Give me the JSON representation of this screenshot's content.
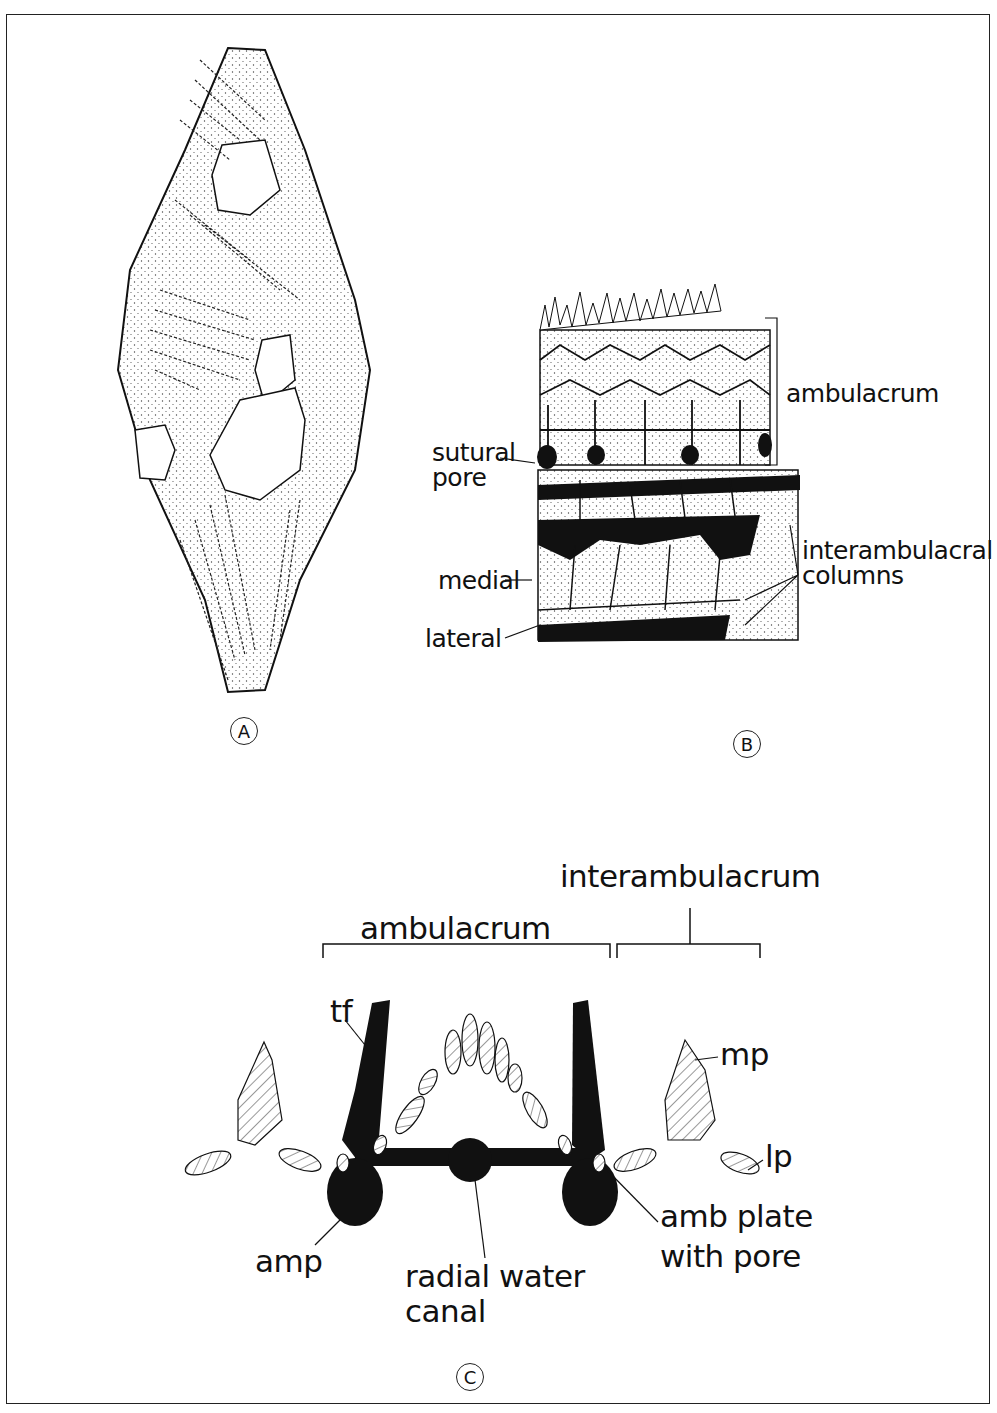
{
  "figure": {
    "panels": [
      {
        "id": "A",
        "label": "A",
        "description": "fossil specimen outline with plate rows"
      },
      {
        "id": "B",
        "label": "B",
        "description": "detail of ambulacrum and interambulacral plates"
      },
      {
        "id": "C",
        "label": "C",
        "description": "cross-section schematic"
      }
    ]
  },
  "panel_b": {
    "labels": {
      "ambulacrum": "ambulacrum",
      "sutural_pore_1": "sutural",
      "sutural_pore_2": "pore",
      "interambulacral_1": "interambulacral",
      "interambulacral_2": "columns",
      "medial": "medial",
      "lateral": "lateral"
    }
  },
  "panel_c": {
    "labels": {
      "interambulacrum": "interambulacrum",
      "ambulacrum": "ambulacrum",
      "tf": "tf",
      "mp": "mp",
      "lp": "lp",
      "amp": "amp",
      "radial_water_canal_1": "radial water",
      "radial_water_canal_2": "canal",
      "amb_plate_1": "amb plate",
      "amb_plate_2": "with pore"
    }
  },
  "colors": {
    "ink": "#111111",
    "background": "#ffffff",
    "stipple": "#555555"
  }
}
